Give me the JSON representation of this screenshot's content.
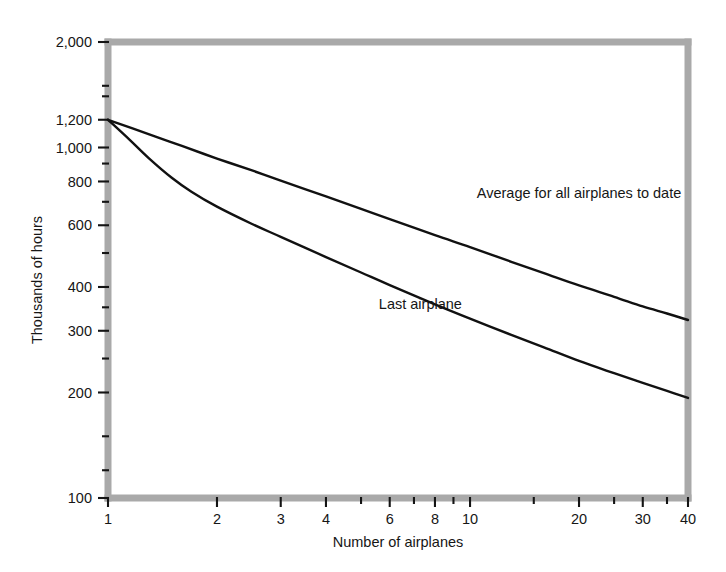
{
  "chart_data": {
    "type": "line",
    "title": "",
    "xlabel": "Number of airplanes",
    "ylabel": "Thousands of hours",
    "xscale": "log",
    "yscale": "log",
    "xlim": [
      1,
      40
    ],
    "ylim": [
      100,
      2000
    ],
    "grid": false,
    "legend_position": "inline-annotation",
    "x_ticks": [
      {
        "value": 1,
        "label": "1"
      },
      {
        "value": 2,
        "label": "2"
      },
      {
        "value": 3,
        "label": "3"
      },
      {
        "value": 4,
        "label": "4"
      },
      {
        "value": 6,
        "label": "6"
      },
      {
        "value": 8,
        "label": "8"
      },
      {
        "value": 10,
        "label": "10"
      },
      {
        "value": 20,
        "label": "20"
      },
      {
        "value": 30,
        "label": "30"
      },
      {
        "value": 40,
        "label": "40"
      }
    ],
    "x_minor_ticks": [
      5,
      7,
      9,
      15,
      25,
      35
    ],
    "y_ticks": [
      {
        "value": 2000,
        "label": "2,000"
      },
      {
        "value": 1200,
        "label": "1,200"
      },
      {
        "value": 1000,
        "label": "1,000"
      },
      {
        "value": 800,
        "label": "800"
      },
      {
        "value": 600,
        "label": "600"
      },
      {
        "value": 400,
        "label": "400"
      },
      {
        "value": 300,
        "label": "300"
      },
      {
        "value": 200,
        "label": "200"
      },
      {
        "value": 100,
        "label": "100"
      }
    ],
    "y_minor_ticks": [
      1500,
      1400,
      900,
      700,
      500,
      350,
      250,
      150,
      120
    ],
    "series": [
      {
        "name": "Average for all airplanes to date",
        "annotation": "Average for all airplanes to date",
        "annotation_x": 20,
        "annotation_y": 720,
        "color": "#111111",
        "points": [
          [
            1,
            1200
          ],
          [
            1.3,
            1090
          ],
          [
            1.6,
            1010
          ],
          [
            2,
            930
          ],
          [
            2.5,
            860
          ],
          [
            3,
            805
          ],
          [
            4,
            725
          ],
          [
            5,
            668
          ],
          [
            6,
            625
          ],
          [
            8,
            562
          ],
          [
            10,
            520
          ],
          [
            13,
            472
          ],
          [
            16,
            438
          ],
          [
            20,
            404
          ],
          [
            25,
            375
          ],
          [
            30,
            352
          ],
          [
            35,
            336
          ],
          [
            40,
            322
          ]
        ]
      },
      {
        "name": "Last airplane",
        "annotation": "Last airplane",
        "annotation_x": 5.6,
        "annotation_y": 345,
        "color": "#111111",
        "points": [
          [
            1,
            1200
          ],
          [
            1.15,
            1050
          ],
          [
            1.3,
            930
          ],
          [
            1.5,
            820
          ],
          [
            1.7,
            748
          ],
          [
            2,
            678
          ],
          [
            2.5,
            605
          ],
          [
            3,
            556
          ],
          [
            4,
            487
          ],
          [
            5,
            440
          ],
          [
            6,
            405
          ],
          [
            8,
            357
          ],
          [
            10,
            325
          ],
          [
            13,
            292
          ],
          [
            16,
            269
          ],
          [
            20,
            246
          ],
          [
            25,
            227
          ],
          [
            30,
            213
          ],
          [
            35,
            202
          ],
          [
            40,
            193
          ]
        ]
      }
    ]
  },
  "figure": {
    "frame_color": "#a9a9a9",
    "curve_color": "#111111",
    "text_color": "#161616",
    "background": "#ffffff"
  }
}
